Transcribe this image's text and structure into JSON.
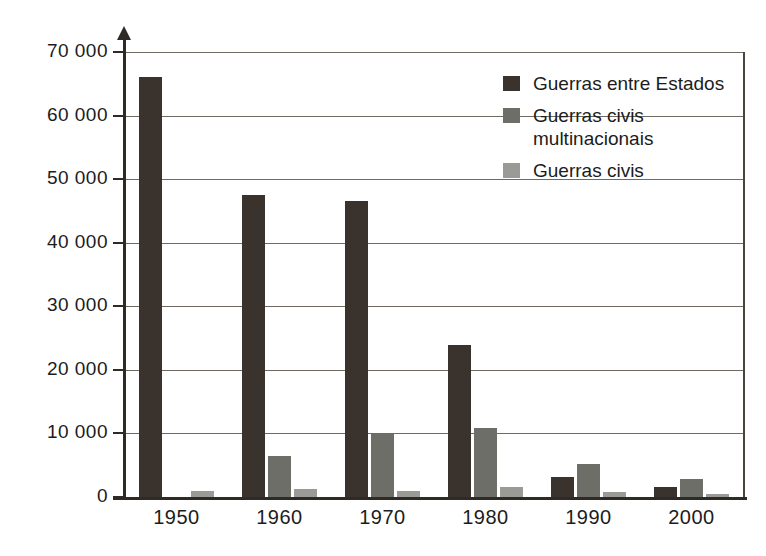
{
  "chart_data": {
    "type": "bar",
    "title": "",
    "xlabel": "",
    "ylabel": "",
    "categories": [
      "1950",
      "1960",
      "1970",
      "1980",
      "1990",
      "2000"
    ],
    "ylim": [
      0,
      70000
    ],
    "yticks": [
      0,
      10000,
      20000,
      30000,
      40000,
      50000,
      60000,
      70000
    ],
    "ytick_labels": [
      "0",
      "10 000",
      "20 000",
      "30 000",
      "40 000",
      "50 000",
      "60 000",
      "70 000"
    ],
    "grid": true,
    "legend_position": "top-right",
    "series": [
      {
        "name": "Guerras entre Estados",
        "color": "#3a322c",
        "values": [
          66000,
          47500,
          46500,
          23900,
          3200,
          1500
        ]
      },
      {
        "name": "Guerras civis multinacionais",
        "color": "#6e6e68",
        "values": [
          0,
          6400,
          9900,
          10800,
          5200,
          2800
        ]
      },
      {
        "name": "Guerras civis",
        "color": "#9a9a96",
        "values": [
          900,
          1200,
          1000,
          1500,
          800,
          500
        ]
      }
    ]
  },
  "legend": {
    "entries": [
      {
        "label": "Guerras entre Estados",
        "color": "#3a322c"
      },
      {
        "label": "Guerras civis\nmultinacionais",
        "color": "#6e6e68"
      },
      {
        "label": "Guerras civis",
        "color": "#9a9a96"
      }
    ]
  },
  "colors": {
    "axis": "#2e2a26",
    "grid": "#6f6a62",
    "background": "#ffffff",
    "text": "#1c1c1c"
  }
}
